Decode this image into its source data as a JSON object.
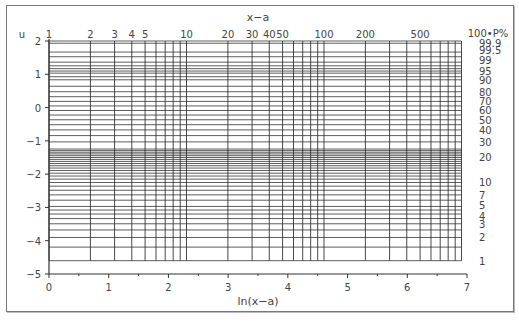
{
  "chart_data": {
    "type": "line",
    "xlabel": "ln(x−a)",
    "ylabel": "u",
    "top_axis_label": "x−a",
    "right_axis_label": "100•P%",
    "xlim": [
      0,
      7
    ],
    "ylim": [
      -5,
      2
    ],
    "grid": true,
    "x_ticks": [
      0,
      1,
      2,
      3,
      4,
      5,
      6,
      7
    ],
    "y_ticks": [
      2,
      1,
      0,
      -1,
      -2,
      -3,
      -4,
      -5
    ],
    "top_ticks": [
      1,
      2,
      3,
      4,
      5,
      10,
      20,
      30,
      40,
      50,
      100,
      200,
      500
    ],
    "top_grid_values": [
      1,
      2,
      3,
      4,
      5,
      6,
      7,
      8,
      9,
      10,
      20,
      30,
      40,
      50,
      60,
      70,
      80,
      90,
      100,
      200,
      300,
      400,
      500,
      600,
      700,
      800,
      900,
      1000
    ],
    "right_ticks": [
      "99.9",
      "99.5",
      "99",
      "95",
      "90",
      "80",
      "70",
      "60",
      "50",
      "40",
      "30",
      "20",
      "10",
      "7",
      "5",
      "4",
      "3",
      "2",
      "1"
    ],
    "right_tick_values": [
      99.9,
      99.5,
      99,
      95,
      90,
      80,
      70,
      60,
      50,
      40,
      30,
      20,
      10,
      7,
      5,
      4,
      3,
      2,
      1
    ],
    "right_grid_values": [
      1,
      1.5,
      2,
      2.5,
      3,
      3.5,
      4,
      4.5,
      5,
      6,
      7,
      8,
      9,
      10,
      11,
      12,
      13,
      14,
      15,
      16,
      17,
      18,
      19,
      20,
      21,
      22,
      23,
      24,
      25,
      30,
      35,
      40,
      45,
      50,
      55,
      60,
      65,
      70,
      75,
      80,
      85,
      90,
      92,
      94,
      95,
      96,
      97,
      98,
      99,
      99.5,
      99.9
    ],
    "relation": "u = ln(-ln(1-P))"
  },
  "labels": {
    "u": "u",
    "top": "x−a",
    "right": "100•P%",
    "bottom": "ln(x−a)"
  }
}
